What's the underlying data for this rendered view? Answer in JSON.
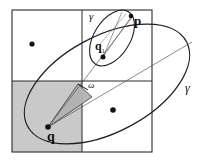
{
  "figure": {
    "background_color": "#ffffff",
    "stroke_color": "#1a1a1a",
    "shade_fill": "#c8c8c8",
    "wedge_fill": "#b4b4b4",
    "labels": {
      "gamma_outer": "γ",
      "gamma_inner": "γ",
      "point_p": "p",
      "point_q": "q",
      "point_q1_base": "q",
      "point_q1_sub": "1",
      "angle_omega": "ω"
    },
    "elements": {
      "grid_name": "quadtree-grid",
      "outer_ellipse_name": "outer-ellipse-gamma",
      "inner_ellipse_name": "inner-ellipse-gamma",
      "wedge_name": "angular-wedge-omega",
      "shaded_quadrant_name": "shaded-lower-left-quadrant"
    },
    "geometry": {
      "square": {
        "x": 12,
        "y": 10,
        "w": 140,
        "h": 142
      },
      "center": {
        "x": 82,
        "y": 81
      },
      "dot_top_left": {
        "x": 32,
        "y": 44
      },
      "dot_bottom_right": {
        "x": 113,
        "y": 110
      },
      "point_q": {
        "x": 48,
        "y": 127
      },
      "point_q1": {
        "x": 103,
        "y": 57
      },
      "point_p": {
        "x": 131,
        "y": 17
      },
      "outer_ellipse": {
        "cx": 107,
        "cy": 84,
        "rx": 90,
        "ry": 48,
        "rotation": -28
      },
      "inner_ellipse": {
        "cx": 112,
        "cy": 38,
        "rx": 18,
        "ry": 31,
        "rotation": 32
      }
    }
  }
}
